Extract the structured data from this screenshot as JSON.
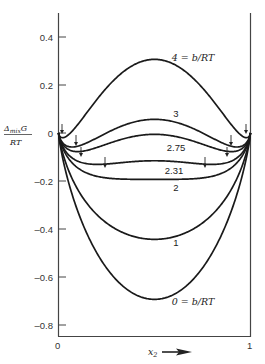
{
  "chart_data": {
    "type": "line",
    "title": "",
    "xlabel": "x2",
    "ylabel": "Δmix G / RT",
    "xlim": [
      0,
      1
    ],
    "ylim": [
      -0.85,
      0.5
    ],
    "grid": false,
    "legend": "inline labels",
    "x_ticks": [
      "0",
      "1"
    ],
    "y_ticks": [
      {
        "value": 0.4,
        "label": "0.4"
      },
      {
        "value": 0.2,
        "label": "0.2"
      },
      {
        "value": 0.0,
        "label": "0"
      },
      {
        "value": -0.2,
        "label": "–0.2"
      },
      {
        "value": -0.4,
        "label": "–0.4"
      },
      {
        "value": -0.6,
        "label": "–0.6"
      },
      {
        "value": -0.8,
        "label": "–0.8"
      }
    ],
    "model": "x2 ln x2 + (1−x2) ln(1−x2) + (b/RT) x2 (1−x2)",
    "series": [
      {
        "name": "4 = b/RT",
        "b": 4,
        "label": "4 = b/RT",
        "label_pos": [
          193,
          61
        ],
        "extremum": 0.307
      },
      {
        "name": "3",
        "b": 3,
        "label": "3",
        "label_pos": [
          176,
          117
        ],
        "extremum": 0.057
      },
      {
        "name": "2.75",
        "b": 2.75,
        "label": "2.75",
        "label_pos": [
          176,
          151
        ],
        "extremum": -0.006
      },
      {
        "name": "2.31",
        "b": 2.31,
        "label": "2.31",
        "label_pos": [
          174,
          174
        ],
        "extremum": -0.116
      },
      {
        "name": "2",
        "b": 2,
        "label": "2",
        "label_pos": [
          176,
          191
        ],
        "extremum": -0.193
      },
      {
        "name": "1",
        "b": 1,
        "label": "1",
        "label_pos": [
          176,
          246
        ],
        "extremum": -0.443
      },
      {
        "name": "0 = b/RT",
        "b": 0,
        "label": "0 = b/RT",
        "label_pos": [
          193,
          305
        ],
        "extremum": -0.693
      }
    ],
    "arrows": [
      {
        "x": 62,
        "y1": 124,
        "y2": 134
      },
      {
        "x": 76,
        "y1": 135,
        "y2": 146
      },
      {
        "x": 81,
        "y1": 147,
        "y2": 157
      },
      {
        "x": 105,
        "y1": 157,
        "y2": 168
      },
      {
        "x": 205,
        "y1": 157,
        "y2": 168
      },
      {
        "x": 227,
        "y1": 147,
        "y2": 157
      },
      {
        "x": 231,
        "y1": 135,
        "y2": 146
      },
      {
        "x": 246,
        "y1": 124,
        "y2": 134
      }
    ]
  },
  "axes": {
    "y_label_top": "Δ",
    "y_label_sub": "mix",
    "y_label_G": "G",
    "y_label_bottom": "RT",
    "x_label": "x",
    "x_label_sub": "2",
    "x0": "0",
    "x1": "1"
  },
  "colors": {
    "line": "#1a1a1a",
    "axis": "#444444",
    "text": "#333333"
  }
}
